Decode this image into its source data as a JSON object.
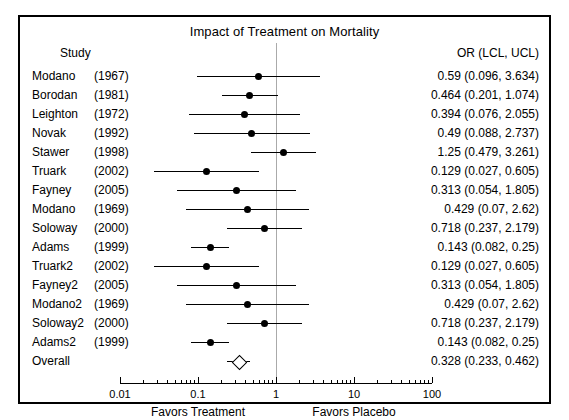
{
  "chart_data": {
    "type": "forest",
    "title": "Impact of Treatment on Mortality",
    "columns": {
      "study": "Study",
      "estimate": "OR (LCL, UCL)"
    },
    "xlabel": "",
    "ylabel": "",
    "xscale": "log",
    "xlim": [
      0.01,
      100
    ],
    "ticks": [
      "0.01",
      "0.1",
      "1",
      "10",
      "100"
    ],
    "tick_values": [
      0.01,
      0.1,
      1,
      10,
      100
    ],
    "null_value": 1,
    "left_caption": "Favors Treatment",
    "right_caption": "Favors Placebo",
    "grid": false,
    "legend": "none",
    "rows": [
      {
        "name": "Modano",
        "year": "(1967)",
        "or": 0.59,
        "lcl": 0.096,
        "ucl": 3.634,
        "text": "0.59 (0.096, 3.634)",
        "summary": false
      },
      {
        "name": "Borodan",
        "year": "(1981)",
        "or": 0.464,
        "lcl": 0.201,
        "ucl": 1.074,
        "text": "0.464 (0.201, 1.074)",
        "summary": false
      },
      {
        "name": "Leighton",
        "year": "(1972)",
        "or": 0.394,
        "lcl": 0.076,
        "ucl": 2.055,
        "text": "0.394 (0.076, 2.055)",
        "summary": false
      },
      {
        "name": "Novak",
        "year": "(1992)",
        "or": 0.49,
        "lcl": 0.088,
        "ucl": 2.737,
        "text": "0.49 (0.088, 2.737)",
        "summary": false
      },
      {
        "name": "Stawer",
        "year": "(1998)",
        "or": 1.25,
        "lcl": 0.479,
        "ucl": 3.261,
        "text": "1.25 (0.479, 3.261)",
        "summary": false
      },
      {
        "name": "Truark",
        "year": "(2002)",
        "or": 0.129,
        "lcl": 0.027,
        "ucl": 0.605,
        "text": "0.129 (0.027, 0.605)",
        "summary": false
      },
      {
        "name": "Fayney",
        "year": "(2005)",
        "or": 0.313,
        "lcl": 0.054,
        "ucl": 1.805,
        "text": "0.313 (0.054, 1.805)",
        "summary": false
      },
      {
        "name": "Modano",
        "year": "(1969)",
        "or": 0.429,
        "lcl": 0.07,
        "ucl": 2.62,
        "text": "0.429 (0.07, 2.62)",
        "summary": false
      },
      {
        "name": "Soloway",
        "year": "(2000)",
        "or": 0.718,
        "lcl": 0.237,
        "ucl": 2.179,
        "text": "0.718 (0.237, 2.179)",
        "summary": false
      },
      {
        "name": "Adams",
        "year": "(1999)",
        "or": 0.143,
        "lcl": 0.082,
        "ucl": 0.25,
        "text": "0.143 (0.082, 0.25)",
        "summary": false
      },
      {
        "name": "Truark2",
        "year": "(2002)",
        "or": 0.129,
        "lcl": 0.027,
        "ucl": 0.605,
        "text": "0.129 (0.027, 0.605)",
        "summary": false
      },
      {
        "name": "Fayney2",
        "year": "(2005)",
        "or": 0.313,
        "lcl": 0.054,
        "ucl": 1.805,
        "text": "0.313 (0.054, 1.805)",
        "summary": false
      },
      {
        "name": "Modano2",
        "year": "(1969)",
        "or": 0.429,
        "lcl": 0.07,
        "ucl": 2.62,
        "text": "0.429 (0.07, 2.62)",
        "summary": false
      },
      {
        "name": "Soloway2",
        "year": "(2000)",
        "or": 0.718,
        "lcl": 0.237,
        "ucl": 2.179,
        "text": "0.718 (0.237, 2.179)",
        "summary": false
      },
      {
        "name": "Adams2",
        "year": "(1999)",
        "or": 0.143,
        "lcl": 0.082,
        "ucl": 0.25,
        "text": "0.143 (0.082, 0.25)",
        "summary": false
      },
      {
        "name": "Overall",
        "year": "",
        "or": 0.328,
        "lcl": 0.233,
        "ucl": 0.462,
        "text": "0.328 (0.233, 0.462)",
        "summary": true
      }
    ]
  },
  "style": {
    "marker_color": "#000000",
    "line_color": "#000000",
    "null_line_color": "#aaaaaa",
    "frame_color": "#000000",
    "background": "#ffffff"
  }
}
